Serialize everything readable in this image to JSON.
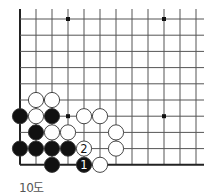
{
  "diagram": {
    "caption": "10도",
    "grid": {
      "origin_x": 20,
      "origin_y": 19,
      "spacing_x": 16,
      "spacing_y": 16.2,
      "cols": 12,
      "rows": 10,
      "right_extent": 204,
      "edges": {
        "left": true,
        "bottom": true,
        "top": false,
        "right": false
      }
    },
    "star_points": [
      {
        "col": 3,
        "row": 0
      },
      {
        "col": 9,
        "row": 0
      },
      {
        "col": 3,
        "row": 6
      },
      {
        "col": 9,
        "row": 6
      }
    ],
    "stones": [
      {
        "color": "white",
        "col": 1,
        "row": 5
      },
      {
        "color": "white",
        "col": 2,
        "row": 5
      },
      {
        "color": "black",
        "col": 0,
        "row": 6
      },
      {
        "color": "white",
        "col": 1,
        "row": 6
      },
      {
        "color": "black",
        "col": 2,
        "row": 6
      },
      {
        "color": "white",
        "col": 4,
        "row": 6
      },
      {
        "color": "white",
        "col": 5,
        "row": 6
      },
      {
        "color": "black",
        "col": 1,
        "row": 7
      },
      {
        "color": "white",
        "col": 2,
        "row": 7
      },
      {
        "color": "white",
        "col": 3,
        "row": 7
      },
      {
        "color": "white",
        "col": 6,
        "row": 7
      },
      {
        "color": "black",
        "col": 0,
        "row": 8
      },
      {
        "color": "black",
        "col": 1,
        "row": 8
      },
      {
        "color": "black",
        "col": 2,
        "row": 8
      },
      {
        "color": "black",
        "col": 3,
        "row": 8
      },
      {
        "color": "white",
        "col": 4,
        "row": 8,
        "label": "2"
      },
      {
        "color": "white",
        "col": 6,
        "row": 8
      },
      {
        "color": "black",
        "col": 2,
        "row": 9
      },
      {
        "color": "black",
        "col": 4,
        "row": 9,
        "label": "1"
      },
      {
        "color": "white",
        "col": 5,
        "row": 9
      }
    ],
    "colors": {
      "line": "#555555",
      "edge": "#222222",
      "black_stone": "#111111",
      "white_stone": "#ffffff",
      "stone_outline": "#333333"
    }
  }
}
